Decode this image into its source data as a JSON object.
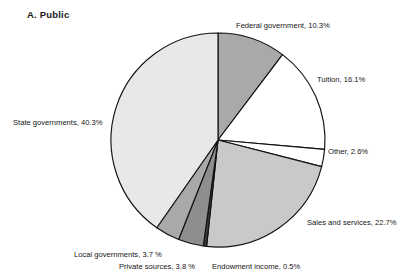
{
  "panel": {
    "title": "A.  Public"
  },
  "chart_data": {
    "type": "pie",
    "title": "A.  Public",
    "subtitle": "",
    "xlabel": "",
    "ylabel": "",
    "legend_position": "none",
    "grid": false,
    "start_angle_deg": 0,
    "direction": "clockwise",
    "center": {
      "x": 218,
      "y": 140
    },
    "radius": 107,
    "labels": [
      "Federal government",
      "Tuition",
      "Other",
      "Sales and services",
      "Endowment income",
      "Private sources",
      "Local governments",
      "State governments"
    ],
    "values": [
      10.3,
      16.1,
      2.6,
      22.7,
      0.5,
      3.8,
      3.7,
      40.3
    ],
    "value_suffix": "%",
    "slices": [
      {
        "name": "Federal government",
        "value": 10.3,
        "label": "Federal government, 10.3%",
        "color": "#a9a9a9",
        "label_x": 236,
        "label_y": 22
      },
      {
        "name": "Tuition",
        "value": 16.1,
        "label": "Tuition, 16.1%",
        "color": "#ffffff",
        "label_x": 317,
        "label_y": 76
      },
      {
        "name": "Other",
        "value": 2.6,
        "label": "Other, 2.6%",
        "color": "#ffffff",
        "label_x": 328,
        "label_y": 148
      },
      {
        "name": "Sales and services",
        "value": 22.7,
        "label": "Sales and services, 22.7%",
        "color": "#c9c9c9",
        "label_x": 307,
        "label_y": 219
      },
      {
        "name": "Endowment income",
        "value": 0.5,
        "label": "Endowment income, 0.5%",
        "color": "#3a3a3a",
        "label_x": 212,
        "label_y": 263
      },
      {
        "name": "Private sources",
        "value": 3.8,
        "label": "Private sources, 3.8 %",
        "color": "#8e8e8e",
        "label_x": 119,
        "label_y": 263
      },
      {
        "name": "Local governments",
        "value": 3.7,
        "label": "Local governments, 3.7 %",
        "color": "#a9a9a9",
        "label_x": 74,
        "label_y": 251
      },
      {
        "name": "State governments",
        "value": 40.3,
        "label": "State governments, 40.3%",
        "color": "#e8e8e8",
        "label_x": 13,
        "label_y": 119
      }
    ]
  }
}
